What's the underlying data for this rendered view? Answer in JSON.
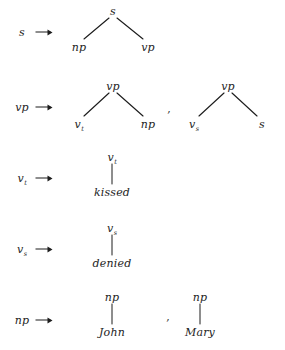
{
  "figure": {
    "kind": "phrase-structure-rewrite-rules",
    "background_color": "#ffffff",
    "ink_color": "#1d1d1d",
    "separator": ","
  },
  "rules": [
    {
      "id": "rule-s",
      "lhs": {
        "label": "s",
        "subscript": ""
      },
      "operator": "arrow",
      "separators": [],
      "trees": [
        {
          "id": "tree-s-np-vp",
          "root": {
            "label": "s",
            "subscript": "",
            "x": 113,
            "y": 11
          },
          "children": [
            {
              "label": "np",
              "subscript": "",
              "x": 79,
              "y": 47
            },
            {
              "label": "vp",
              "subscript": "",
              "x": 148,
              "y": 47
            }
          ]
        }
      ]
    },
    {
      "id": "rule-vp",
      "lhs": {
        "label": "vp",
        "subscript": ""
      },
      "operator": "arrow",
      "separators": [
        {
          "mark": ",",
          "x": 169,
          "y": 108
        }
      ],
      "trees": [
        {
          "id": "tree-vp-vt-np",
          "root": {
            "label": "vp",
            "subscript": "",
            "x": 113,
            "y": 86
          },
          "children": [
            {
              "label": "v",
              "subscript": "t",
              "x": 79,
              "y": 124
            },
            {
              "label": "np",
              "subscript": "",
              "x": 148,
              "y": 124
            }
          ]
        },
        {
          "id": "tree-vp-vs-s",
          "root": {
            "label": "vp",
            "subscript": "",
            "x": 228,
            "y": 86
          },
          "children": [
            {
              "label": "v",
              "subscript": "s",
              "x": 194,
              "y": 124
            },
            {
              "label": "s",
              "subscript": "",
              "x": 262,
              "y": 124
            }
          ]
        }
      ]
    },
    {
      "id": "rule-vt",
      "lhs": {
        "label": "v",
        "subscript": "t"
      },
      "operator": "arrow",
      "separators": [],
      "trees": [
        {
          "id": "tree-vt-kissed",
          "root": {
            "label": "v",
            "subscript": "t",
            "x": 112,
            "y": 157
          },
          "children": [
            {
              "label": "kissed",
              "subscript": "",
              "x": 112,
              "y": 192,
              "terminal": true
            }
          ]
        }
      ]
    },
    {
      "id": "rule-vs",
      "lhs": {
        "label": "v",
        "subscript": "s"
      },
      "operator": "arrow",
      "separators": [],
      "trees": [
        {
          "id": "tree-vs-denied",
          "root": {
            "label": "v",
            "subscript": "s",
            "x": 112,
            "y": 228
          },
          "children": [
            {
              "label": "denied",
              "subscript": "",
              "x": 112,
              "y": 263,
              "terminal": true
            }
          ]
        }
      ]
    },
    {
      "id": "rule-np",
      "lhs": {
        "label": "np",
        "subscript": ""
      },
      "operator": "arrow",
      "separators": [
        {
          "mark": ",",
          "x": 168,
          "y": 316
        }
      ],
      "trees": [
        {
          "id": "tree-np-john",
          "root": {
            "label": "np",
            "subscript": "",
            "x": 112,
            "y": 297
          },
          "children": [
            {
              "label": "John",
              "subscript": "",
              "x": 112,
              "y": 332,
              "terminal": true
            }
          ]
        },
        {
          "id": "tree-np-mary",
          "root": {
            "label": "np",
            "subscript": "",
            "x": 200,
            "y": 297
          },
          "children": [
            {
              "label": "Mary",
              "subscript": "",
              "x": 200,
              "y": 332,
              "terminal": true
            }
          ]
        }
      ]
    }
  ],
  "lhs_column": {
    "label_x": 22,
    "arrow_x": 44,
    "rows_y": [
      32,
      107,
      178,
      249,
      320
    ]
  }
}
